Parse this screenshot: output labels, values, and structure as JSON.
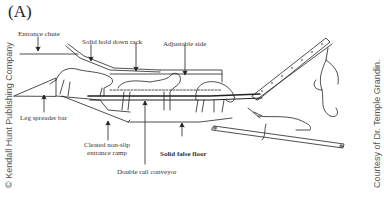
{
  "figure": {
    "panel_label": "(A)",
    "labels": {
      "entrance_chute": "Entrance chute",
      "solid_hold_down_rack": "Solid hold down rack",
      "adjustable_side": "Adjustable side",
      "leg_spreader_bar": "Leg spreader bar",
      "cleated_ramp_line1": "Cleated non-slip",
      "cleated_ramp_line2": "entrance ramp",
      "solid_false_floor": "Solid false floor",
      "double_rail_conveyor": "Double rail conveyor"
    },
    "credits": {
      "left": "© Kendall Hunt Publishing Company",
      "right": "Courtesy of Dr. Temple Grandin."
    }
  },
  "colors": {
    "line": "#222222",
    "text": "#333333",
    "credit": "#555555",
    "background": "#ffffff"
  }
}
